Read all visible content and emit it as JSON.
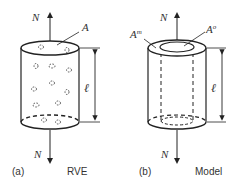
{
  "panels": [
    {
      "id": "a",
      "tag": "(a)",
      "caption": "RVE",
      "labels": {
        "force_top": "N",
        "force_bottom": "N",
        "area": "A",
        "length": "ℓ"
      }
    },
    {
      "id": "b",
      "tag": "(b)",
      "caption": "Model",
      "labels": {
        "force_top": "N",
        "force_bottom": "N",
        "area_matrix": "A",
        "area_matrix_sup": "m",
        "area_outer": "A",
        "area_outer_sup": "o",
        "length": "ℓ"
      }
    }
  ],
  "colors": {
    "stroke": "#222222",
    "text": "#333333"
  }
}
